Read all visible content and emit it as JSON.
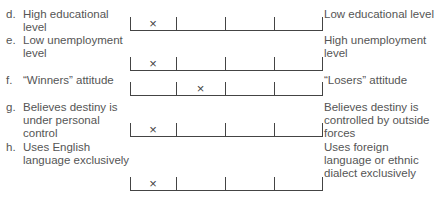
{
  "scale": {
    "points": 4,
    "ticks_x": [
      0,
      46,
      95,
      144,
      192
    ]
  },
  "items": [
    {
      "letter": "d.",
      "left": "High educational level",
      "right": "Low educational level",
      "mark": "×",
      "mark_position": 1,
      "top": 8,
      "line_y": 31
    },
    {
      "letter": "e.",
      "left": "Low unemployment level",
      "right": "High unemployment level",
      "mark": "×",
      "mark_position": 1,
      "top": 34,
      "line_y": 71
    },
    {
      "letter": "f.",
      "left": "“Winners” attitude",
      "right": "“Losers” attitude",
      "mark": "×",
      "mark_position": 2,
      "top": 74,
      "line_y": 96
    },
    {
      "letter": "g.",
      "left": "Believes destiny is under personal control",
      "right": "Believes destiny is controlled by outside forces",
      "mark": "×",
      "mark_position": 1,
      "top": 101,
      "line_y": 137
    },
    {
      "letter": "h.",
      "left": "Uses English language exclusively",
      "right": "Uses foreign language or ethnic dialect exclusively",
      "mark": "×",
      "mark_position": 1,
      "top": 141,
      "line_y": 191
    }
  ]
}
